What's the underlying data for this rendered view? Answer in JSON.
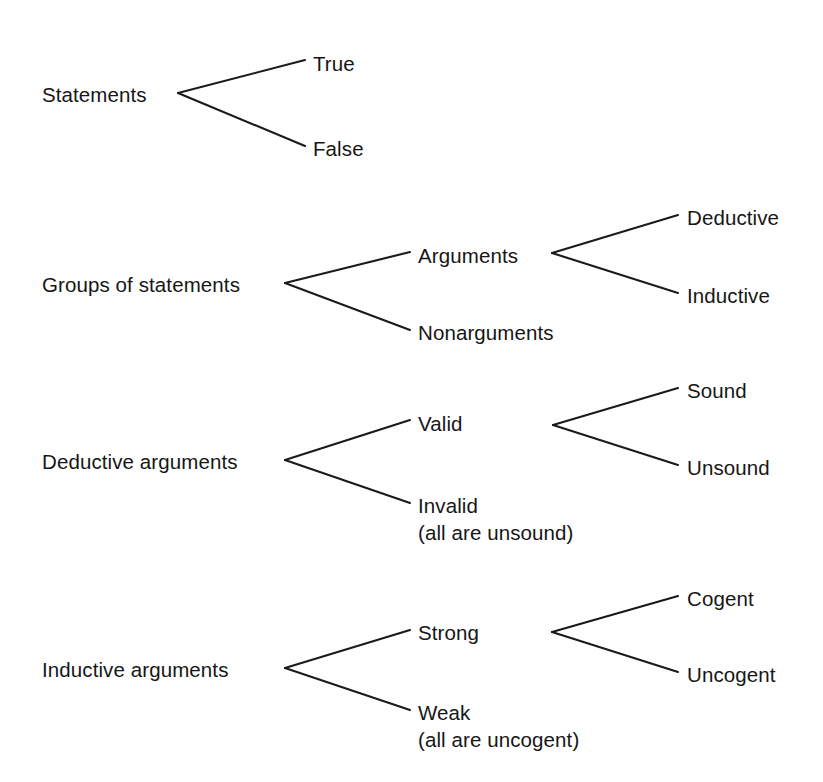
{
  "diagram": {
    "type": "tree",
    "background_color": "#ffffff",
    "text_color": "#161616",
    "line_color": "#1a1a1a",
    "groups": [
      {
        "id": "statements",
        "root": {
          "label": "Statements",
          "x": 42,
          "y": 101
        },
        "forks": [
          {
            "id": "statements-fork",
            "vertex": {
              "x": 178,
              "y": 93
            },
            "branch_end_x": 305,
            "children": [
              {
                "label": "True",
                "x": 313,
                "y": 70,
                "line_y": 60
              },
              {
                "label": "False",
                "x": 313,
                "y": 155,
                "line_y": 146
              }
            ]
          }
        ]
      },
      {
        "id": "groups-of-statements",
        "root": {
          "label": "Groups of statements",
          "x": 42,
          "y": 291
        },
        "forks": [
          {
            "id": "groups-fork",
            "vertex": {
              "x": 285,
              "y": 283
            },
            "branch_end_x": 410,
            "children": [
              {
                "label": "Arguments",
                "x": 418,
                "y": 262,
                "line_y": 252
              },
              {
                "label": "Nonarguments",
                "x": 418,
                "y": 339,
                "line_y": 330
              }
            ]
          },
          {
            "id": "arguments-fork",
            "vertex": {
              "x": 552,
              "y": 253
            },
            "branch_end_x": 678,
            "children": [
              {
                "label": "Deductive",
                "x": 687,
                "y": 224,
                "line_y": 215
              },
              {
                "label": "Inductive",
                "x": 687,
                "y": 302,
                "line_y": 293
              }
            ]
          }
        ]
      },
      {
        "id": "deductive-arguments",
        "root": {
          "label": "Deductive arguments",
          "x": 42,
          "y": 468
        },
        "forks": [
          {
            "id": "deductive-fork",
            "vertex": {
              "x": 285,
              "y": 460
            },
            "branch_end_x": 410,
            "children": [
              {
                "label": "Valid",
                "x": 418,
                "y": 430,
                "line_y": 420
              },
              {
                "label": "Invalid",
                "sub_label": "(all are unsound)",
                "x": 418,
                "y": 512,
                "line_y": 503
              }
            ]
          },
          {
            "id": "valid-fork",
            "vertex": {
              "x": 553,
              "y": 425,
              "x_end_left": 553
            },
            "branch_end_x": 678,
            "children": [
              {
                "label": "Sound",
                "x": 687,
                "y": 397,
                "line_y": 388
              },
              {
                "label": "Unsound",
                "x": 687,
                "y": 474,
                "line_y": 465
              }
            ]
          }
        ]
      },
      {
        "id": "inductive-arguments",
        "root": {
          "label": "Inductive arguments",
          "x": 42,
          "y": 676
        },
        "forks": [
          {
            "id": "inductive-fork",
            "vertex": {
              "x": 285,
              "y": 668
            },
            "branch_end_x": 410,
            "children": [
              {
                "label": "Strong",
                "x": 418,
                "y": 639,
                "line_y": 630
              },
              {
                "label": "Weak",
                "sub_label": "(all are uncogent)",
                "x": 418,
                "y": 719,
                "line_y": 710
              }
            ]
          },
          {
            "id": "strong-fork",
            "vertex": {
              "x": 552,
              "y": 632
            },
            "branch_end_x": 678,
            "children": [
              {
                "label": "Cogent",
                "x": 687,
                "y": 605,
                "line_y": 596
              },
              {
                "label": "Uncogent",
                "x": 687,
                "y": 681,
                "line_y": 672
              }
            ]
          }
        ]
      }
    ]
  }
}
